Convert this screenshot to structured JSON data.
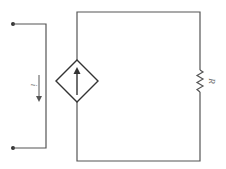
{
  "diagram": {
    "type": "circuit",
    "components": {
      "dependent_current_source": {
        "label": "",
        "direction": "up"
      },
      "resistor": {
        "label": "R"
      },
      "current_indicator": {
        "label": "i",
        "direction": "down"
      }
    },
    "terminals": [
      {
        "name": "top-terminal"
      },
      {
        "name": "bottom-terminal"
      }
    ],
    "colors": {
      "wire": "#555555",
      "label": "#666666",
      "background": "#ffffff"
    }
  }
}
